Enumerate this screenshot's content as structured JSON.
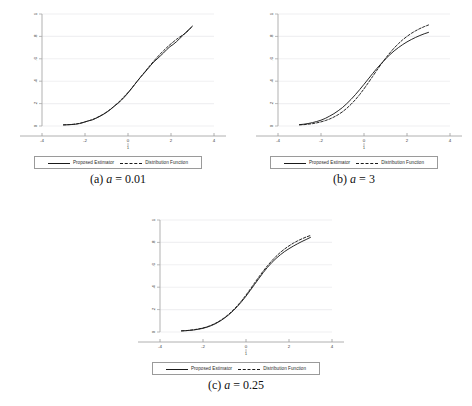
{
  "figure": {
    "panels": [
      {
        "id": "a",
        "caption_index": "(a)",
        "caption_var": "a",
        "caption_eq": "=",
        "caption_value": "0.01",
        "legend": [
          {
            "label": "Proposed Estimator",
            "style": "solid"
          },
          {
            "label": "Distribution Function",
            "style": "dashed"
          }
        ]
      },
      {
        "id": "b",
        "caption_index": "(b)",
        "caption_var": "a",
        "caption_eq": "=",
        "caption_value": "3",
        "legend": [
          {
            "label": "Proposed Estimator",
            "style": "solid"
          },
          {
            "label": "Distribution Function",
            "style": "dashed"
          }
        ]
      },
      {
        "id": "c",
        "caption_index": "(c)",
        "caption_var": "a",
        "caption_eq": "=",
        "caption_value": "0.25",
        "legend": [
          {
            "label": "Proposed Estimator",
            "style": "solid"
          },
          {
            "label": "Distribution Function",
            "style": "dashed"
          }
        ]
      }
    ]
  },
  "chart_data": [
    {
      "type": "line",
      "title": "(a) a = 0.01",
      "xlabel": "",
      "ylabel": "",
      "xlim": [
        -4,
        4
      ],
      "ylim": [
        0,
        1
      ],
      "xticks": [
        -4,
        -2,
        0,
        2,
        4
      ],
      "xticklabels": [
        "-4",
        "-2",
        "0",
        "2",
        "4"
      ],
      "sub_xtick_label": "1",
      "yticks": [
        0,
        0.2,
        0.4,
        0.6,
        0.8,
        1
      ],
      "yticklabels": [
        "0",
        ".2",
        ".4",
        ".6",
        ".8",
        "1"
      ],
      "grid": "horizontal",
      "legend_position": "below-axes",
      "series": [
        {
          "name": "Proposed Estimator",
          "style": "solid",
          "color": "#1a1a1a",
          "x": [
            -3.0,
            -2.85,
            -2.7,
            -2.55,
            -2.4,
            -2.25,
            -2.1,
            -1.95,
            -1.8,
            -1.65,
            -1.5,
            -1.35,
            -1.2,
            -1.05,
            -0.9,
            -0.75,
            -0.6,
            -0.45,
            -0.3,
            -0.15,
            0.0,
            0.15,
            0.3,
            0.45,
            0.6,
            0.75,
            0.9,
            1.05,
            1.2,
            1.35,
            1.5,
            1.65,
            1.8,
            1.95,
            2.1,
            2.25,
            2.4,
            2.55,
            2.7,
            2.85,
            3.0
          ],
          "y": [
            0.01,
            0.011,
            0.012,
            0.014,
            0.017,
            0.022,
            0.03,
            0.04,
            0.048,
            0.055,
            0.068,
            0.082,
            0.098,
            0.115,
            0.135,
            0.158,
            0.183,
            0.205,
            0.232,
            0.262,
            0.295,
            0.33,
            0.368,
            0.405,
            0.44,
            0.472,
            0.505,
            0.54,
            0.572,
            0.598,
            0.625,
            0.652,
            0.682,
            0.708,
            0.728,
            0.752,
            0.78,
            0.808,
            0.838,
            0.865,
            0.892
          ]
        },
        {
          "name": "Distribution Function",
          "style": "dashed",
          "color": "#1a1a1a",
          "x": [
            -3.0,
            -2.85,
            -2.7,
            -2.55,
            -2.4,
            -2.25,
            -2.1,
            -1.95,
            -1.8,
            -1.65,
            -1.5,
            -1.35,
            -1.2,
            -1.05,
            -0.9,
            -0.75,
            -0.6,
            -0.45,
            -0.3,
            -0.15,
            0.0,
            0.15,
            0.3,
            0.45,
            0.6,
            0.75,
            0.9,
            1.05,
            1.2,
            1.35,
            1.5,
            1.65,
            1.8,
            1.95,
            2.1,
            2.25,
            2.4,
            2.55,
            2.7,
            2.85,
            3.0
          ],
          "y": [
            0.01,
            0.011,
            0.013,
            0.015,
            0.019,
            0.024,
            0.031,
            0.039,
            0.048,
            0.058,
            0.07,
            0.085,
            0.1,
            0.118,
            0.138,
            0.16,
            0.184,
            0.21,
            0.238,
            0.268,
            0.3,
            0.333,
            0.368,
            0.404,
            0.44,
            0.476,
            0.512,
            0.546,
            0.58,
            0.612,
            0.643,
            0.672,
            0.7,
            0.726,
            0.75,
            0.773,
            0.794,
            0.813,
            0.831,
            0.862,
            0.89
          ]
        }
      ]
    },
    {
      "type": "line",
      "title": "(b) a = 3",
      "xlabel": "",
      "ylabel": "",
      "xlim": [
        -4,
        4
      ],
      "ylim": [
        0,
        1
      ],
      "xticks": [
        -4,
        -2,
        0,
        2,
        4
      ],
      "xticklabels": [
        "-4",
        "-2",
        "0",
        "2",
        "4"
      ],
      "sub_xtick_label": "1",
      "yticks": [
        0,
        0.2,
        0.4,
        0.6,
        0.8,
        1
      ],
      "yticklabels": [
        "0",
        ".2",
        ".4",
        ".6",
        ".8",
        "1"
      ],
      "grid": "horizontal",
      "legend_position": "below-axes",
      "series": [
        {
          "name": "Proposed Estimator",
          "style": "solid",
          "color": "#1a1a1a",
          "x": [
            -3.0,
            -2.8,
            -2.6,
            -2.4,
            -2.2,
            -2.0,
            -1.8,
            -1.6,
            -1.4,
            -1.2,
            -1.0,
            -0.8,
            -0.6,
            -0.4,
            -0.2,
            0.0,
            0.2,
            0.4,
            0.6,
            0.8,
            1.0,
            1.2,
            1.4,
            1.6,
            1.8,
            2.0,
            2.2,
            2.4,
            2.6,
            2.8,
            3.0
          ],
          "y": [
            0.012,
            0.016,
            0.022,
            0.03,
            0.04,
            0.052,
            0.068,
            0.088,
            0.11,
            0.136,
            0.165,
            0.2,
            0.238,
            0.28,
            0.325,
            0.372,
            0.42,
            0.468,
            0.514,
            0.557,
            0.598,
            0.636,
            0.67,
            0.7,
            0.727,
            0.751,
            0.772,
            0.791,
            0.808,
            0.823,
            0.836
          ]
        },
        {
          "name": "Distribution Function",
          "style": "dashed",
          "color": "#1a1a1a",
          "x": [
            -3.0,
            -2.8,
            -2.6,
            -2.4,
            -2.2,
            -2.0,
            -1.8,
            -1.6,
            -1.4,
            -1.2,
            -1.0,
            -0.8,
            -0.6,
            -0.4,
            -0.2,
            0.0,
            0.2,
            0.4,
            0.6,
            0.8,
            1.0,
            1.2,
            1.4,
            1.6,
            1.8,
            2.0,
            2.2,
            2.4,
            2.6,
            2.8,
            3.0
          ],
          "y": [
            0.01,
            0.012,
            0.016,
            0.021,
            0.028,
            0.037,
            0.048,
            0.062,
            0.08,
            0.101,
            0.127,
            0.158,
            0.194,
            0.235,
            0.281,
            0.332,
            0.386,
            0.442,
            0.498,
            0.552,
            0.604,
            0.652,
            0.696,
            0.735,
            0.77,
            0.8,
            0.827,
            0.85,
            0.87,
            0.887,
            0.902
          ]
        }
      ]
    },
    {
      "type": "line",
      "title": "(c) a = 0.25",
      "xlabel": "",
      "ylabel": "",
      "xlim": [
        -4,
        4
      ],
      "ylim": [
        0,
        1
      ],
      "xticks": [
        -4,
        -2,
        0,
        2,
        4
      ],
      "xticklabels": [
        "-4",
        "-2",
        "0",
        "2",
        "4"
      ],
      "sub_xtick_label": "1",
      "yticks": [
        0,
        0.2,
        0.4,
        0.6,
        0.8,
        1
      ],
      "yticklabels": [
        "0",
        ".2",
        ".4",
        ".6",
        ".8",
        "1"
      ],
      "grid": "horizontal",
      "legend_position": "below-axes",
      "series": [
        {
          "name": "Proposed Estimator",
          "style": "solid",
          "color": "#1a1a1a",
          "x": [
            -3.0,
            -2.8,
            -2.6,
            -2.4,
            -2.2,
            -2.0,
            -1.8,
            -1.6,
            -1.4,
            -1.2,
            -1.0,
            -0.8,
            -0.6,
            -0.4,
            -0.2,
            0.0,
            0.2,
            0.4,
            0.6,
            0.8,
            1.0,
            1.2,
            1.4,
            1.6,
            1.8,
            2.0,
            2.2,
            2.4,
            2.6,
            2.8,
            3.0
          ],
          "y": [
            0.01,
            0.012,
            0.015,
            0.019,
            0.025,
            0.033,
            0.044,
            0.058,
            0.076,
            0.098,
            0.124,
            0.154,
            0.189,
            0.228,
            0.272,
            0.32,
            0.372,
            0.425,
            0.478,
            0.53,
            0.578,
            0.62,
            0.657,
            0.69,
            0.719,
            0.744,
            0.767,
            0.788,
            0.808,
            0.826,
            0.845
          ]
        },
        {
          "name": "Distribution Function",
          "style": "dashed",
          "color": "#1a1a1a",
          "x": [
            -3.0,
            -2.8,
            -2.6,
            -2.4,
            -2.2,
            -2.0,
            -1.8,
            -1.6,
            -1.4,
            -1.2,
            -1.0,
            -0.8,
            -0.6,
            -0.4,
            -0.2,
            0.0,
            0.2,
            0.4,
            0.6,
            0.8,
            1.0,
            1.2,
            1.4,
            1.6,
            1.8,
            2.0,
            2.2,
            2.4,
            2.6,
            2.8,
            3.0
          ],
          "y": [
            0.01,
            0.012,
            0.016,
            0.021,
            0.028,
            0.036,
            0.047,
            0.062,
            0.08,
            0.102,
            0.128,
            0.159,
            0.195,
            0.235,
            0.28,
            0.33,
            0.383,
            0.438,
            0.492,
            0.544,
            0.592,
            0.636,
            0.676,
            0.711,
            0.742,
            0.769,
            0.793,
            0.814,
            0.832,
            0.848,
            0.862
          ]
        }
      ]
    }
  ]
}
